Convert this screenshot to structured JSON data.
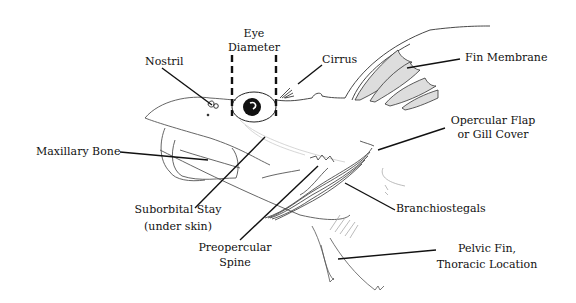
{
  "diagram": {
    "labels": {
      "eye_diameter": [
        "Eye",
        "Diameter"
      ],
      "nostril": "Nostril",
      "cirrus": "Cirrus",
      "fin_membrane": "Fin Membrane",
      "opercular_flap": [
        "Opercular Flap",
        "or Gill Cover"
      ],
      "maxillary_bone": "Maxillary Bone",
      "suborbital_stay": [
        "Suborbital Stay",
        "(under skin)"
      ],
      "preopercular_spine": [
        "Preopercular",
        "Spine"
      ],
      "branchiostegals": "Branchiostegals",
      "pelvic_fin": [
        "Pelvic Fin,",
        "Thoracic Location"
      ]
    },
    "colors": {
      "line": "#111111",
      "sketch": "#555555",
      "shading": "#cfcfcf",
      "background": "#ffffff"
    }
  }
}
